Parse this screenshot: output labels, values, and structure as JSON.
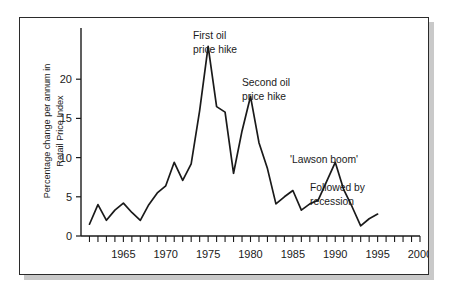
{
  "figure": {
    "caption_visible": false,
    "frame_color": "#2b2b2b",
    "line_color": "#1a1a1a",
    "background": "#ffffff"
  },
  "chart_data": {
    "type": "line",
    "title": "",
    "xlabel": "",
    "ylabel": "Percentage change per annum in Retail Price Index",
    "ylabel_line1": "Percentage change per annum in",
    "ylabel_line2": "Retail Price Index",
    "xlim": [
      1960,
      2000
    ],
    "ylim": [
      0,
      25
    ],
    "yticks": [
      0,
      5,
      10,
      15,
      20
    ],
    "ytick_labels": [
      "0",
      "5",
      "10",
      "15",
      "20"
    ],
    "xticks": [
      1965,
      1970,
      1975,
      1980,
      1985,
      1990,
      1995,
      2000
    ],
    "xtick_labels": [
      "1965",
      "1970",
      "1975",
      "1980",
      "1985",
      "1990",
      "1995",
      "2000"
    ],
    "minor_xticks_every": 1,
    "grid": false,
    "legend": null,
    "series": [
      {
        "name": "Retail Price Index annual change",
        "x": [
          1961,
          1962,
          1963,
          1964,
          1965,
          1966,
          1967,
          1968,
          1969,
          1970,
          1971,
          1972,
          1973,
          1974,
          1975,
          1976,
          1977,
          1978,
          1979,
          1980,
          1981,
          1982,
          1983,
          1984,
          1985,
          1986,
          1987,
          1988,
          1989,
          1990,
          1991,
          1992,
          1993,
          1994,
          1995
        ],
        "values": [
          1.5,
          4.0,
          2.0,
          3.3,
          4.2,
          3.0,
          2.0,
          4.0,
          5.5,
          6.4,
          9.4,
          7.1,
          9.2,
          16.0,
          24.2,
          16.5,
          15.8,
          8.0,
          13.4,
          17.8,
          11.9,
          8.6,
          4.1,
          5.0,
          5.8,
          3.3,
          4.1,
          4.6,
          7.0,
          9.4,
          5.9,
          3.7,
          1.3,
          2.2,
          2.8
        ]
      }
    ],
    "annotations": [
      {
        "id": "first-oil-hike",
        "line1": "First oil",
        "line2": "price hike",
        "near_x": 1975,
        "near_y": 24.2
      },
      {
        "id": "second-oil-hike",
        "line1": "Second oil",
        "line2": "price hike",
        "near_x": 1980,
        "near_y": 17.8
      },
      {
        "id": "lawson-boom",
        "line1": "'Lawson boom'",
        "line2": "",
        "near_x": 1990,
        "near_y": 9.4
      },
      {
        "id": "followed-by-recession",
        "line1": "Followed by",
        "line2": "recession",
        "near_x": 1993,
        "near_y": 1.3
      }
    ]
  }
}
